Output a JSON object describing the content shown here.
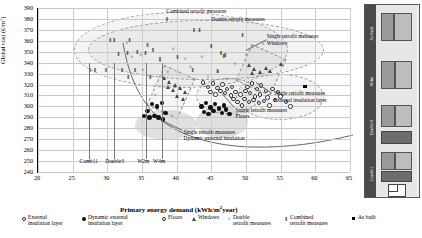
{
  "chart_data": {
    "type": "scatter",
    "title": "",
    "xlabel": "Primary energy demand (kWh/m²year)",
    "ylabel": "Global cost (€/m²)",
    "xlim": [
      20,
      65
    ],
    "ylim": [
      240,
      390
    ],
    "xticks": [
      20,
      25,
      30,
      35,
      40,
      45,
      50,
      55,
      60,
      65
    ],
    "yticks": [
      240,
      250,
      260,
      270,
      280,
      290,
      300,
      310,
      320,
      330,
      340,
      350,
      360,
      370,
      380,
      390
    ],
    "grid": true,
    "legend_position": "bottom",
    "series": [
      {
        "name": "External insulation layer",
        "marker": "open-circle",
        "points": [
          [
            50.2,
            318
          ],
          [
            50.9,
            321
          ],
          [
            51.6,
            316
          ],
          [
            52.2,
            319
          ],
          [
            52.9,
            314
          ],
          [
            50.6,
            312
          ],
          [
            51.3,
            309
          ],
          [
            52.0,
            311
          ],
          [
            53.1,
            308
          ],
          [
            49.8,
            307
          ],
          [
            50.4,
            304
          ],
          [
            51.1,
            306
          ],
          [
            51.9,
            303
          ],
          [
            52.6,
            305
          ],
          [
            53.4,
            301
          ],
          [
            54.2,
            306
          ],
          [
            55.0,
            309
          ],
          [
            55.8,
            304
          ],
          [
            54.6,
            313
          ],
          [
            53.8,
            316
          ],
          [
            56.4,
            300
          ],
          [
            49.4,
            301
          ],
          [
            48.8,
            304
          ],
          [
            48.2,
            307
          ]
        ]
      },
      {
        "name": "Dynamic external insulation layer",
        "marker": "filled-circle",
        "points": [
          [
            35.3,
            291
          ],
          [
            36.1,
            290
          ],
          [
            36.8,
            291
          ],
          [
            37.4,
            290
          ],
          [
            38.0,
            288
          ],
          [
            36.4,
            302
          ],
          [
            37.2,
            300
          ],
          [
            37.9,
            303
          ],
          [
            35.8,
            296
          ],
          [
            38.4,
            294
          ],
          [
            43.6,
            300
          ],
          [
            44.2,
            303
          ],
          [
            44.9,
            299
          ],
          [
            45.5,
            302
          ],
          [
            46.1,
            298
          ],
          [
            46.8,
            301
          ],
          [
            43.9,
            295
          ],
          [
            44.6,
            293
          ],
          [
            45.3,
            296
          ],
          [
            46.5,
            294
          ],
          [
            47.1,
            297
          ],
          [
            47.6,
            293
          ]
        ]
      },
      {
        "name": "Floors",
        "marker": "open-circle-small",
        "points": [
          [
            44.5,
            318
          ],
          [
            45.2,
            321
          ],
          [
            45.9,
            317
          ],
          [
            46.6,
            320
          ],
          [
            47.3,
            316
          ],
          [
            48.0,
            318
          ],
          [
            44.9,
            313
          ],
          [
            45.6,
            311
          ],
          [
            46.3,
            314
          ],
          [
            47.0,
            312
          ],
          [
            47.8,
            310
          ],
          [
            48.5,
            313
          ],
          [
            43.8,
            322
          ],
          [
            49.2,
            311
          ],
          [
            49.9,
            314
          ]
        ]
      },
      {
        "name": "Windows",
        "marker": "triangle",
        "points": [
          [
            38.2,
            325
          ],
          [
            39.0,
            322
          ],
          [
            39.8,
            319
          ],
          [
            40.6,
            316
          ],
          [
            41.3,
            313
          ],
          [
            38.8,
            317
          ],
          [
            39.6,
            314
          ],
          [
            50.5,
            337
          ],
          [
            51.3,
            334
          ],
          [
            52.1,
            331
          ],
          [
            52.9,
            335
          ],
          [
            53.6,
            332
          ],
          [
            50.9,
            330
          ],
          [
            55.1,
            338
          ],
          [
            40.2,
            309
          ],
          [
            41.0,
            306
          ]
        ]
      },
      {
        "name": "Double retrofit measures",
        "marker": "x-cross",
        "points": [
          [
            32.8,
            358
          ],
          [
            35.1,
            333
          ],
          [
            38.7,
            331
          ],
          [
            41.2,
            343
          ],
          [
            43.6,
            345
          ],
          [
            46.0,
            331
          ],
          [
            48.4,
            339
          ],
          [
            50.0,
            347
          ],
          [
            44.5,
            327
          ],
          [
            36.9,
            310
          ],
          [
            33.5,
            345
          ],
          [
            39.5,
            352
          ],
          [
            42.0,
            336
          ],
          [
            47.2,
            325
          ],
          [
            52.5,
            357
          ],
          [
            34.8,
            347
          ],
          [
            37.6,
            341
          ]
        ]
      },
      {
        "name": "Combined retrofit measures",
        "marker": "bold-I",
        "points": [
          [
            30.4,
            361
          ],
          [
            33.2,
            361
          ],
          [
            35.8,
            356
          ],
          [
            37.6,
            343
          ],
          [
            40.1,
            345
          ],
          [
            42.5,
            370
          ],
          [
            43.3,
            370
          ],
          [
            45.0,
            355
          ],
          [
            46.4,
            349
          ],
          [
            47.0,
            347
          ],
          [
            46.8,
            346
          ],
          [
            49.5,
            365
          ],
          [
            38.6,
            380
          ],
          [
            31.6,
            348
          ],
          [
            32.9,
            349
          ],
          [
            34.3,
            350
          ],
          [
            35.5,
            349
          ],
          [
            36.6,
            351
          ],
          [
            29.8,
            333
          ],
          [
            32.1,
            333
          ],
          [
            34.0,
            333
          ],
          [
            42.3,
            333
          ],
          [
            45.9,
            332
          ],
          [
            33.0,
            327
          ],
          [
            36.2,
            327
          ],
          [
            28.2,
            333
          ],
          [
            31.0,
            361
          ],
          [
            27.5,
            333
          ]
        ]
      },
      {
        "name": "As built",
        "marker": "filled-square",
        "points": [
          [
            58.5,
            318
          ]
        ]
      }
    ],
    "annotations": [
      {
        "text": "Combined retrofit measures",
        "x": 38.5,
        "y": 387
      },
      {
        "text": "Double retrofit measures",
        "x": 45.0,
        "y": 380
      },
      {
        "text": "Single retrofit measures",
        "x": 53.0,
        "y": 364
      },
      {
        "text": "Windows",
        "x": 53.0,
        "y": 358
      },
      {
        "text": "Single retrofit measures",
        "x": 54.0,
        "y": 312
      },
      {
        "text": "External insulation layer",
        "x": 54.0,
        "y": 306
      },
      {
        "text": "Single retrofit measures",
        "x": 48.5,
        "y": 297
      },
      {
        "text": "Floors",
        "x": 48.5,
        "y": 291
      },
      {
        "text": "Single retrofit measures",
        "x": 41.0,
        "y": 277
      },
      {
        "text": "Dynamic external insulation",
        "x": 41.0,
        "y": 271
      }
    ],
    "reference_lines": [
      {
        "label": "Comb11",
        "x": 27.3
      },
      {
        "label": "Double3",
        "x": 31.0
      },
      {
        "label": "W2m",
        "x": 35.6
      },
      {
        "label": "W4m",
        "x": 37.9
      }
    ],
    "pareto_curve": {
      "description": "cost-optimal frontier curve descending from high cost at low energy demand to minimum near 40 kWh then rising slightly",
      "points": [
        [
          27.0,
          365
        ],
        [
          28.0,
          345
        ],
        [
          29.5,
          328
        ],
        [
          31.5,
          315
        ],
        [
          34.0,
          303
        ],
        [
          37.0,
          295
        ],
        [
          40.5,
          290
        ],
        [
          44.0,
          288
        ],
        [
          48.0,
          288
        ],
        [
          52.0,
          290
        ],
        [
          56.0,
          294
        ],
        [
          60.0,
          299
        ]
      ]
    }
  },
  "legend": {
    "items": [
      {
        "label_line1": "External",
        "label_line2": "insulation layer",
        "marker": "open-circle"
      },
      {
        "label_line1": "Dynamic external",
        "label_line2": "insulation layer",
        "marker": "filled-circle"
      },
      {
        "label_line1": "Floors",
        "label_line2": "",
        "marker": "open-circle-small"
      },
      {
        "label_line1": "Windows",
        "label_line2": "",
        "marker": "triangle"
      },
      {
        "label_line1": "Double",
        "label_line2": "retrofit measures",
        "marker": "x-cross"
      },
      {
        "label_line1": "Combined",
        "label_line2": "retrofit measures",
        "marker": "bold-I"
      },
      {
        "label_line1": "As built",
        "label_line2": "",
        "marker": "filled-square"
      }
    ]
  },
  "side_panel": {
    "rows": [
      {
        "label": "As built"
      },
      {
        "label": "W4m"
      },
      {
        "label": "Double3"
      },
      {
        "label": "Comb11"
      }
    ]
  }
}
